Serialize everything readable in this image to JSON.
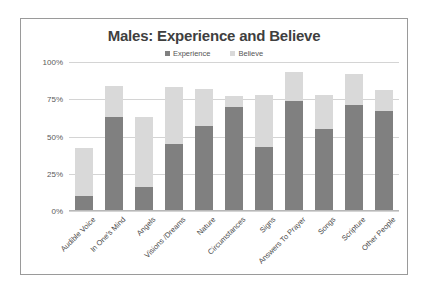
{
  "chart_data": {
    "type": "bar",
    "subtype": "stacked-bar",
    "title": "Males: Experience and Believe",
    "xlabel": "",
    "ylabel": "",
    "ylim": [
      0,
      100
    ],
    "ytick_labels": [
      "0%",
      "25%",
      "50%",
      "75%",
      "100%"
    ],
    "ytick_values": [
      0,
      25,
      50,
      75,
      100
    ],
    "grid": true,
    "legend_position": "top",
    "categories": [
      "Audible Voice",
      "In One's Mind",
      "Angels",
      "Visions /Dreams",
      "Nature",
      "Circumstances",
      "Signs",
      "Answers To Prayer",
      "Songs",
      "Scripture",
      "Other People"
    ],
    "series": [
      {
        "name": "Experience",
        "color": "#808080",
        "values": [
          10,
          63,
          16,
          45,
          57,
          70,
          43,
          74,
          55,
          71,
          67
        ]
      },
      {
        "name": "Believe",
        "color": "#d9d9d9",
        "values": [
          32,
          21,
          47,
          38,
          25,
          7,
          35,
          19,
          23,
          21,
          14
        ]
      }
    ],
    "stacked_totals": [
      42,
      84,
      63,
      83,
      82,
      77,
      78,
      93,
      78,
      92,
      81
    ]
  },
  "legend": {
    "items": [
      {
        "label": "Experience",
        "color": "#808080"
      },
      {
        "label": "Believe",
        "color": "#d9d9d9"
      }
    ]
  },
  "colors": {
    "experience": "#808080",
    "believe": "#d9d9d9",
    "gridline": "#d4d4d4",
    "frame": "#9a9a9a",
    "title_text": "#3f3f3f",
    "axis_text": "#5a5a5a"
  }
}
